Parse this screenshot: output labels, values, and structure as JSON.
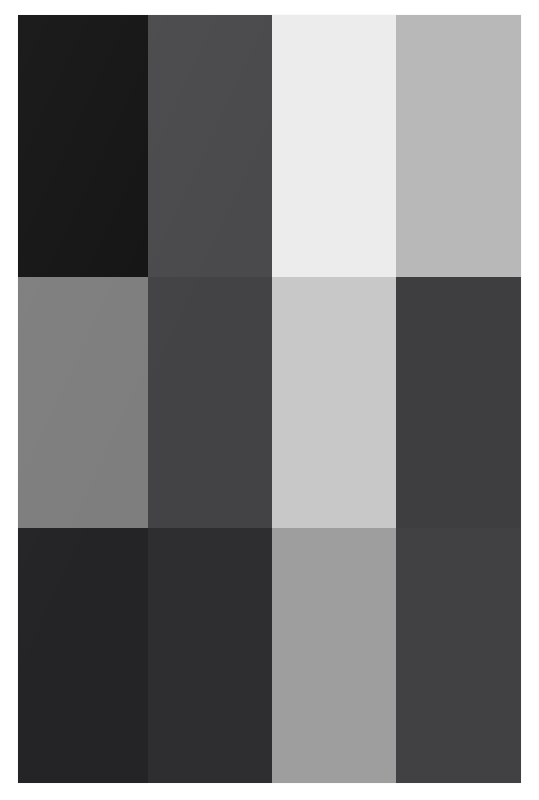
{
  "image": {
    "title": "Grayscale Swatch Grid",
    "description": "A 4-column by 3-row grid of flat grayscale color swatches on a white background",
    "background_color": "#ffffff",
    "canvas": {
      "width": 539,
      "height": 800
    },
    "block": {
      "left": 18,
      "top": 15,
      "width": 503,
      "height": 768
    }
  },
  "grid": {
    "columns": 4,
    "rows": 3,
    "column_widths": [
      130,
      124,
      124,
      125
    ],
    "row_heights": [
      262,
      251,
      255
    ],
    "gap": 0
  },
  "swatches": [
    {
      "row": 1,
      "column": 1,
      "name": "near-black",
      "color": "#141414",
      "gray_value": 20
    },
    {
      "row": 1,
      "column": 2,
      "name": "dark-slate-gray",
      "color": "#4a4a4c",
      "gray_value": 74
    },
    {
      "row": 1,
      "column": 3,
      "name": "off-white",
      "color": "#ececec",
      "gray_value": 236
    },
    {
      "row": 1,
      "column": 4,
      "name": "light-gray",
      "color": "#b8b8b8",
      "gray_value": 184
    },
    {
      "row": 2,
      "column": 1,
      "name": "medium-gray",
      "color": "#7e7e7e",
      "gray_value": 126
    },
    {
      "row": 2,
      "column": 2,
      "name": "charcoal-gray",
      "color": "#434345",
      "gray_value": 67
    },
    {
      "row": 2,
      "column": 3,
      "name": "pale-gray",
      "color": "#c8c8c8",
      "gray_value": 200
    },
    {
      "row": 2,
      "column": 4,
      "name": "deep-charcoal",
      "color": "#3e3e40",
      "gray_value": 62
    },
    {
      "row": 3,
      "column": 1,
      "name": "very-dark-gray",
      "color": "#242426",
      "gray_value": 36
    },
    {
      "row": 3,
      "column": 2,
      "name": "dark-gray",
      "color": "#2e2e30",
      "gray_value": 46
    },
    {
      "row": 3,
      "column": 3,
      "name": "mid-light-gray",
      "color": "#9e9e9e",
      "gray_value": 158
    },
    {
      "row": 3,
      "column": 4,
      "name": "graphite-gray",
      "color": "#414143",
      "gray_value": 65
    }
  ]
}
